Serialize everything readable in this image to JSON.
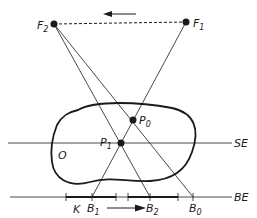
{
  "diagram": {
    "type": "tomography-geometry",
    "colors": {
      "stroke": "#1a1a1a",
      "background": "#ffffff"
    },
    "labels": {
      "F2": {
        "main": "F",
        "sub": "2"
      },
      "F1": {
        "main": "F",
        "sub": "1"
      },
      "P0": {
        "main": "P",
        "sub": "0"
      },
      "P1": {
        "main": "P",
        "sub": "1"
      },
      "O": {
        "main": "O"
      },
      "SE": {
        "main": "SE"
      },
      "BE": {
        "main": "BE"
      },
      "K": {
        "main": "K"
      },
      "B1": {
        "main": "B",
        "sub": "1"
      },
      "B2": {
        "main": "B",
        "sub": "2"
      },
      "B0": {
        "main": "B",
        "sub": "0"
      }
    },
    "points": {
      "F2": [
        54,
        24
      ],
      "F1": [
        186,
        22
      ],
      "P0": [
        133,
        120
      ],
      "P1": [
        121,
        143
      ],
      "B1": [
        92,
        197
      ],
      "B2": [
        150,
        197
      ],
      "B0": [
        193,
        197
      ]
    },
    "arrows": {
      "top": {
        "direction": "left",
        "meaning": "focus motion F1 to F2"
      },
      "bottom": {
        "direction": "right",
        "meaning": "film motion"
      }
    },
    "lines": [
      "SE",
      "BE",
      "F2-F1 dashed",
      "F1-B1",
      "F2-B2",
      "F2-B0"
    ]
  }
}
